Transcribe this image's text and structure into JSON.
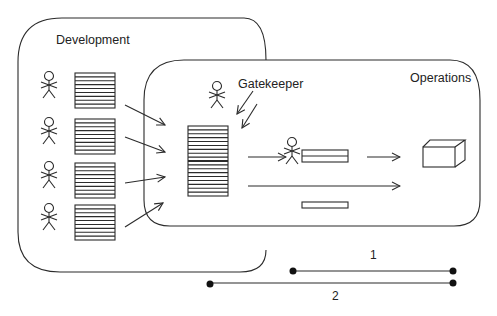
{
  "diagram": {
    "development_label": "Development",
    "operations_label": "Operations",
    "gatekeeper_label": "Gatekeeper",
    "timeline": [
      {
        "label": "1",
        "description": "shorter timeline starting inside Operations"
      },
      {
        "label": "2",
        "description": "longer timeline starting inside Development"
      }
    ],
    "colors": {
      "stroke": "#2b2b2b",
      "background": "#ffffff"
    },
    "developers_count": 4,
    "icons": [
      "stick-figure-icon",
      "document-stack-icon",
      "arrow-icon",
      "box-3d-icon"
    ]
  }
}
